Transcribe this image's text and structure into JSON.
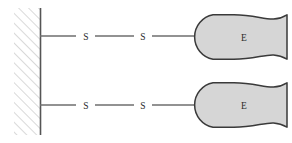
{
  "figure": {
    "kind": "mechanical-schematic",
    "background_color": "#ffffff",
    "canvas": {
      "width": 292,
      "height": 143
    }
  },
  "colors": {
    "wall_hatch": "#b9b9b9",
    "wall_border": "#555555",
    "wall_fill": "#ffffff",
    "connector_line": "#6e6e6e",
    "element_fill": "#d6d6d6",
    "element_stroke": "#3a3a3a",
    "text": "#2b2b2b"
  },
  "wall": {
    "name": "fixed-support-wall",
    "hatch_direction": "lower-left-to-upper-right",
    "left_x": 14,
    "right_x": 40,
    "top_y": 8,
    "bottom_y": 135,
    "hatch_spacing": 7,
    "hatch_stroke_width": 1
  },
  "branches": [
    {
      "id": "upper-branch",
      "y": 36,
      "anchor_x": 40,
      "segments": [
        {
          "x1": 40,
          "x2": 76
        },
        {
          "x1": 95,
          "x2": 134
        },
        {
          "x1": 152,
          "x2": 212
        }
      ],
      "labels": [
        {
          "id": "upper-spring-1",
          "text": "S",
          "x": 86,
          "y": 36
        },
        {
          "id": "upper-spring-2",
          "text": "S",
          "x": 143,
          "y": 36
        }
      ],
      "element": {
        "id": "upper-element",
        "text": "E",
        "left_x": 212,
        "right_x": 288,
        "top_y": 14,
        "bottom_y": 60,
        "text_x": 244,
        "text_y": 37
      }
    },
    {
      "id": "lower-branch",
      "y": 105,
      "anchor_x": 40,
      "segments": [
        {
          "x1": 40,
          "x2": 76
        },
        {
          "x1": 95,
          "x2": 134
        },
        {
          "x1": 152,
          "x2": 212
        }
      ],
      "labels": [
        {
          "id": "lower-spring-1",
          "text": "S",
          "x": 86,
          "y": 105
        },
        {
          "id": "lower-spring-2",
          "text": "S",
          "x": 143,
          "y": 105
        }
      ],
      "element": {
        "id": "lower-element",
        "text": "E",
        "left_x": 212,
        "right_x": 288,
        "top_y": 82,
        "bottom_y": 128,
        "text_x": 244,
        "text_y": 105
      }
    }
  ],
  "legend_keys": {
    "S": "S",
    "E": "E"
  }
}
